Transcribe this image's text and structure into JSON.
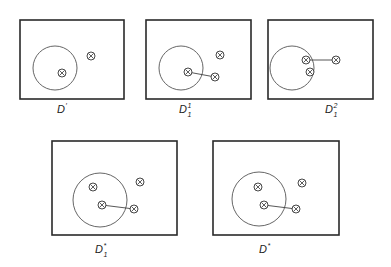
{
  "figure": {
    "panels": [
      {
        "id": "D-prime",
        "label": "D",
        "label_sup": "′",
        "label_sub": "",
        "frame": {
          "x": 20,
          "y": 20,
          "w": 104,
          "h": 79
        },
        "circle": {
          "cx": 55,
          "cy": 68,
          "r": 22
        },
        "points": [
          {
            "x": 62,
            "y": 73
          },
          {
            "x": 91,
            "y": 56
          }
        ],
        "links": [],
        "label_pos": {
          "x": 57,
          "y": 113
        }
      },
      {
        "id": "D1-1",
        "label": "D",
        "label_sup": "1",
        "label_sub": "1",
        "frame": {
          "x": 146,
          "y": 20,
          "w": 105,
          "h": 79
        },
        "circle": {
          "cx": 181,
          "cy": 68,
          "r": 22
        },
        "points": [
          {
            "x": 188,
            "y": 72
          },
          {
            "x": 220,
            "y": 55
          },
          {
            "x": 215,
            "y": 77
          }
        ],
        "links": [
          {
            "x1": 188,
            "y1": 72,
            "x2": 215,
            "y2": 77
          }
        ],
        "label_pos": {
          "x": 179,
          "y": 113
        }
      },
      {
        "id": "D1-2",
        "label": "D",
        "label_sup": "2",
        "label_sub": "1",
        "frame": {
          "x": 268,
          "y": 20,
          "w": 105,
          "h": 79
        },
        "circle": {
          "cx": 292,
          "cy": 68,
          "r": 22
        },
        "points": [
          {
            "x": 306,
            "y": 60
          },
          {
            "x": 310,
            "y": 72
          },
          {
            "x": 336,
            "y": 60
          }
        ],
        "links": [
          {
            "x1": 306,
            "y1": 60,
            "x2": 336,
            "y2": 60
          }
        ],
        "label_pos": {
          "x": 325,
          "y": 113
        }
      },
      {
        "id": "D1-star",
        "label": "D",
        "label_sup": "*",
        "label_sub": "1",
        "frame": {
          "x": 52,
          "y": 141,
          "w": 125,
          "h": 94
        },
        "circle": {
          "cx": 100,
          "cy": 200,
          "r": 27
        },
        "points": [
          {
            "x": 93,
            "y": 187
          },
          {
            "x": 102,
            "y": 205
          },
          {
            "x": 140,
            "y": 182
          },
          {
            "x": 134,
            "y": 209
          }
        ],
        "links": [
          {
            "x1": 102,
            "y1": 205,
            "x2": 134,
            "y2": 209
          }
        ],
        "label_pos": {
          "x": 95,
          "y": 253
        }
      },
      {
        "id": "D-star",
        "label": "D",
        "label_sup": "*",
        "label_sub": "",
        "frame": {
          "x": 213,
          "y": 141,
          "w": 126,
          "h": 94
        },
        "circle": {
          "cx": 259,
          "cy": 199,
          "r": 27
        },
        "points": [
          {
            "x": 258,
            "y": 187
          },
          {
            "x": 264,
            "y": 205
          },
          {
            "x": 302,
            "y": 183
          },
          {
            "x": 296,
            "y": 209
          }
        ],
        "links": [
          {
            "x1": 264,
            "y1": 205,
            "x2": 296,
            "y2": 209
          }
        ],
        "label_pos": {
          "x": 259,
          "y": 253
        }
      }
    ],
    "point_symbol": "circled-x",
    "colors": {
      "frame": "#2a2a2a",
      "circle": "#555555",
      "point": "#333333",
      "text": "#222222"
    }
  }
}
